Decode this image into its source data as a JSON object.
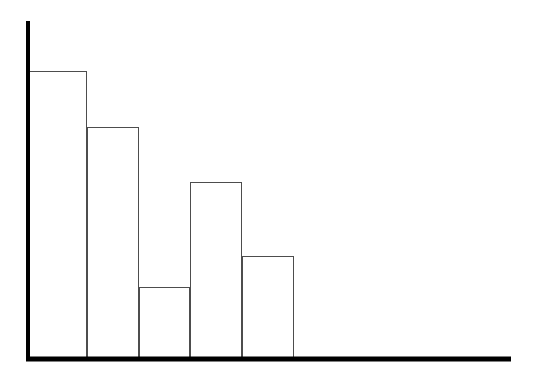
{
  "figure": {
    "background_color": "#ffffff",
    "width": 544,
    "height": 381
  },
  "chart_data": {
    "type": "bar",
    "title": "",
    "subtitle": "",
    "xlabel": "",
    "ylabel": "",
    "categories": [
      "1",
      "2",
      "3",
      "4",
      "5"
    ],
    "tick_labels": [],
    "legend": [],
    "legend_position": "none",
    "grid": false,
    "annotations": [],
    "xlim": [
      0,
      5
    ],
    "ylim": [
      0,
      300
    ],
    "values": [
      288,
      232,
      72,
      177,
      103
    ],
    "bar_style": {
      "fill_color": "#ffffff",
      "edge_color": "#4d4d4d",
      "edge_width": 1.4,
      "gap": 0
    },
    "series": [
      {
        "name": "counts",
        "values": [
          288,
          232,
          72,
          177,
          103
        ]
      }
    ]
  },
  "axes": {
    "color": "#000000",
    "line_width": 4,
    "y_axis": {
      "x": 28,
      "y_top": 21,
      "y_bottom": 361
    },
    "x_axis": {
      "y": 359,
      "x_left": 26,
      "x_right": 511
    },
    "ticks_visible": false
  },
  "bars": [
    {
      "index": 0,
      "x0": 29,
      "x1": 87,
      "top": 71,
      "value": 288
    },
    {
      "index": 1,
      "x0": 87,
      "x1": 139,
      "top": 127,
      "value": 232
    },
    {
      "index": 2,
      "x0": 139,
      "x1": 190,
      "top": 287,
      "value": 72
    },
    {
      "index": 3,
      "x0": 190,
      "x1": 242,
      "top": 182,
      "value": 177
    },
    {
      "index": 4,
      "x0": 242,
      "x1": 294,
      "top": 256,
      "value": 103
    }
  ]
}
